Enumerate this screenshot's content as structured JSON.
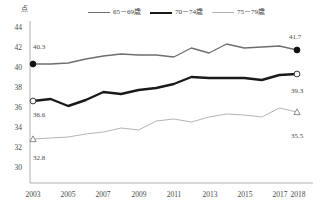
{
  "chart_data": {
    "type": "line",
    "title": "",
    "unit_label": "点",
    "xlabel": "",
    "ylabel": "",
    "ylim": [
      30,
      44
    ],
    "xlim": [
      2003,
      2018
    ],
    "grid": false,
    "legend_position": "top-center",
    "x": [
      2003,
      2004,
      2005,
      2006,
      2007,
      2008,
      2009,
      2010,
      2011,
      2012,
      2013,
      2014,
      2015,
      2016,
      2017,
      2018
    ],
    "xticks": [
      "2003",
      "2005",
      "2007",
      "2009",
      "2011",
      "2013",
      "2015",
      "2017",
      "2018"
    ],
    "yticks": [
      "30",
      "32",
      "34",
      "36",
      "38",
      "40",
      "42",
      "44"
    ],
    "series": [
      {
        "name": "65－69歳",
        "color": "#6e6e6e",
        "values": [
          40.3,
          40.3,
          40.4,
          40.8,
          41.1,
          41.3,
          41.2,
          41.2,
          41.0,
          41.9,
          41.4,
          42.3,
          41.9,
          42.0,
          42.1,
          41.7
        ],
        "start_label": "40.3",
        "end_label": "41.7",
        "marker": "filled-circle"
      },
      {
        "name": "70－74歳",
        "color": "#1a1a1a",
        "values": [
          36.6,
          36.8,
          36.1,
          36.7,
          37.5,
          37.3,
          37.7,
          37.9,
          38.3,
          39.0,
          38.9,
          38.9,
          38.9,
          38.7,
          39.2,
          39.3
        ],
        "start_label": "36.6",
        "end_label": "39.3",
        "marker": "open-circle"
      },
      {
        "name": "75－79歳",
        "color": "#b4b4b4",
        "values": [
          32.8,
          32.9,
          33.0,
          33.3,
          33.5,
          33.9,
          33.7,
          34.6,
          34.8,
          34.5,
          35.0,
          35.3,
          35.2,
          35.0,
          35.9,
          35.5
        ],
        "start_label": "32.8",
        "end_label": "35.5",
        "marker": "open-triangle"
      }
    ]
  },
  "legend": {
    "items": [
      {
        "label": "65－69歳"
      },
      {
        "label": "70－74歳"
      },
      {
        "label": "75－79歳"
      }
    ]
  },
  "axis": {
    "unit": "点",
    "y": [
      "44",
      "42",
      "40",
      "38",
      "36",
      "34",
      "32",
      "30"
    ],
    "x": [
      "2003",
      "2005",
      "2007",
      "2009",
      "2011",
      "2013",
      "2015",
      "2017",
      "2018"
    ]
  },
  "annotations": {
    "a_start": "40.3",
    "a_end": "41.7",
    "b_start": "36.6",
    "b_end": "39.3",
    "c_start": "32.8",
    "c_end": "35.5"
  }
}
